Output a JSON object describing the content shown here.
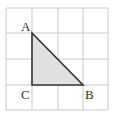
{
  "diagram": {
    "type": "grid-triangle",
    "grid": {
      "columns": 4,
      "rows": 4,
      "line_color": "#c8c8c8",
      "x_lines": [
        6,
        32,
        58,
        83,
        108
      ],
      "y_lines": [
        8,
        33,
        59,
        85,
        110
      ]
    },
    "triangle": {
      "vertices": {
        "A": {
          "grid": [
            1,
            1
          ],
          "px": [
            32,
            33
          ]
        },
        "B": {
          "grid": [
            3,
            3
          ],
          "px": [
            83,
            85
          ]
        },
        "C": {
          "grid": [
            1,
            3
          ],
          "px": [
            32,
            85
          ]
        }
      },
      "fill_color": "#e0e0e0",
      "stroke_color": "#333333",
      "right_angle_at": "C"
    },
    "labels": {
      "A": "A",
      "B": "B",
      "C": "C"
    }
  }
}
